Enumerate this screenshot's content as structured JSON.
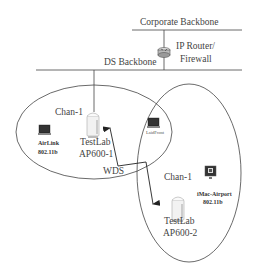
{
  "diagram": {
    "backbones": {
      "corporate": "Corporate Backbone",
      "ds": "DS Backbone"
    },
    "router": {
      "label_line1": "IP Router/",
      "label_line2": "Firewall",
      "icon": "router-icon"
    },
    "cells": [
      {
        "channel": "Chan-1",
        "ap": {
          "name": "TestLab",
          "model": "AP600-1",
          "icon": "access-point-icon"
        },
        "clients": [
          {
            "name": "AirLink",
            "standard": "802.11b",
            "icon": "laptop-icon"
          },
          {
            "name": "LaidFront",
            "standard": "",
            "icon": "laptop-icon"
          }
        ]
      },
      {
        "channel": "Chan-1",
        "ap": {
          "name": "TestLab",
          "model": "AP600-2",
          "icon": "access-point-icon"
        },
        "clients": [
          {
            "name": "iMac-Airport",
            "standard": "802.11b",
            "icon": "imac-icon"
          }
        ]
      }
    ],
    "link": {
      "label": "WDS"
    },
    "colors": {
      "lines": "#333333",
      "background": "#ffffff"
    }
  }
}
